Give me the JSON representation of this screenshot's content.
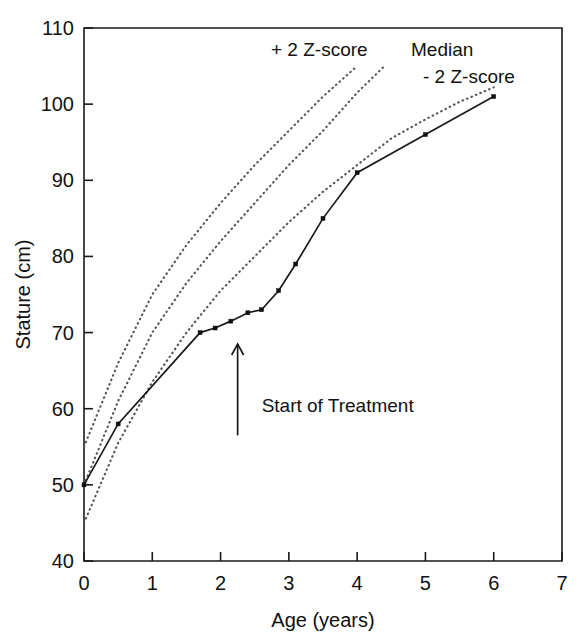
{
  "chart_data": {
    "type": "line",
    "title": "",
    "xlabel": "Age (years)",
    "ylabel": "Stature (cm)",
    "xlim": [
      0,
      7
    ],
    "ylim": [
      40,
      110
    ],
    "xticks": [
      "0",
      "1",
      "2",
      "3",
      "4",
      "5",
      "6",
      "7"
    ],
    "yticks": [
      "40",
      "50",
      "60",
      "70",
      "80",
      "90",
      "100",
      "110"
    ],
    "grid": false,
    "legend_position": "inline-annotations",
    "series": [
      {
        "name": "+ 2 Z-score",
        "style": "dotted",
        "label": "+ 2 Z-score",
        "x": [
          0,
          0.5,
          1,
          1.5,
          2,
          2.5,
          3,
          3.5,
          4
        ],
        "values": [
          55,
          66,
          75,
          81.5,
          87,
          92,
          96.5,
          101,
          105
        ]
      },
      {
        "name": "Median",
        "style": "dotted",
        "label": "Median",
        "x": [
          0,
          0.5,
          1,
          1.5,
          2,
          2.5,
          3,
          3.5,
          4,
          4.4
        ],
        "values": [
          50,
          61,
          70,
          76.5,
          82,
          87,
          92,
          96.5,
          101.5,
          105
        ]
      },
      {
        "name": "- 2 Z-score",
        "style": "dotted",
        "label": "- 2 Z-score",
        "x": [
          0,
          0.5,
          1,
          1.5,
          2,
          2.5,
          3,
          3.5,
          4,
          4.5,
          5,
          5.5,
          6
        ],
        "values": [
          45,
          55.5,
          63.5,
          70,
          75.5,
          80,
          84.5,
          88.5,
          92,
          95.5,
          98,
          100.3,
          102.2
        ]
      },
      {
        "name": "Patient stature",
        "style": "solid-markers",
        "label": "",
        "x": [
          0,
          0.5,
          1.7,
          1.92,
          2.15,
          2.4,
          2.6,
          2.85,
          3.1,
          3.5,
          4,
          5,
          6
        ],
        "values": [
          50,
          58,
          70,
          70.6,
          71.5,
          72.6,
          73,
          75.5,
          79,
          85,
          91,
          96,
          101
        ]
      }
    ],
    "annotations": [
      {
        "name": "start-of-treatment",
        "text": "Start of Treatment",
        "x": 2.25,
        "y": 60,
        "arrow": "up"
      }
    ]
  }
}
